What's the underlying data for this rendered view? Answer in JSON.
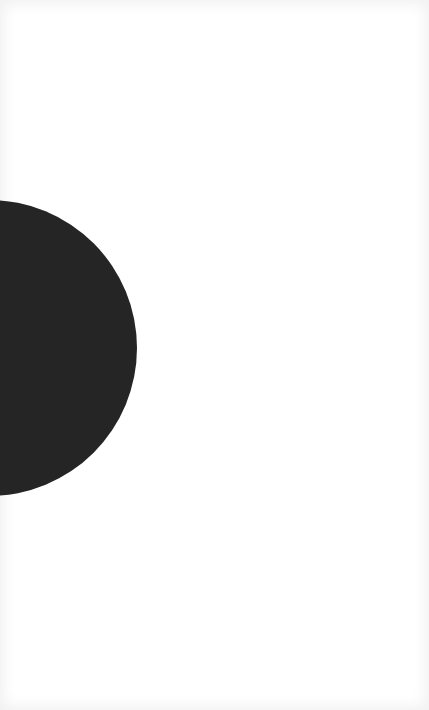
{
  "canvas": {
    "width": 429,
    "height": 710,
    "background": "#ffffff"
  },
  "shape": {
    "type": "circle",
    "color": "#252525",
    "center_x": -11,
    "center_y": 348,
    "radius": 148,
    "clipped_by_left_edge": true
  }
}
